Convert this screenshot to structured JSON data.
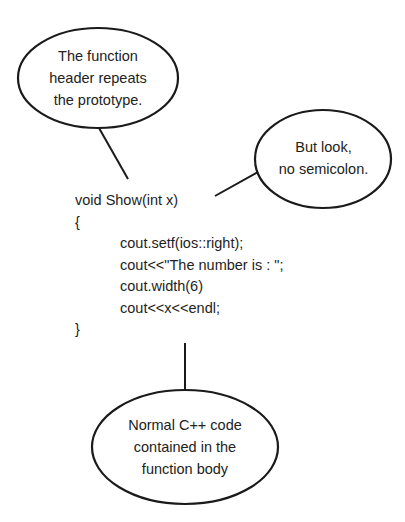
{
  "colors": {
    "stroke": "#1a1a1a",
    "text": "#1e1e1e",
    "background": "#ffffff"
  },
  "callouts": {
    "header": {
      "lines": [
        "The function",
        "header repeats",
        "the prototype."
      ]
    },
    "semicolon": {
      "lines": [
        "But look,",
        "no semicolon."
      ]
    },
    "body": {
      "lines": [
        "Normal C++ code",
        "contained in the",
        "function body"
      ]
    }
  },
  "code": {
    "lines": [
      {
        "text": "void Show(int x)",
        "indent": false
      },
      {
        "text": "{",
        "indent": false
      },
      {
        "text": "cout.setf(ios::right);",
        "indent": true
      },
      {
        "text": "cout<<\"The number is : \";",
        "indent": true
      },
      {
        "text": "cout.width(6)",
        "indent": true
      },
      {
        "text": "cout<<x<<endl;",
        "indent": true
      },
      {
        "text": "}",
        "indent": false
      }
    ]
  }
}
